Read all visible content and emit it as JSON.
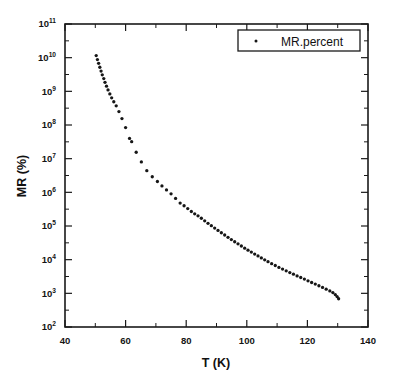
{
  "figure": {
    "background_color": "#ffffff",
    "ink_color": "#161616"
  },
  "axes": {
    "x_title": "T (K)",
    "y_title": "MR (%)",
    "x_ticklabels": [
      "40",
      "60",
      "80",
      "100",
      "120",
      "140"
    ],
    "x_tickvalues": [
      40,
      60,
      80,
      100,
      120,
      140
    ],
    "x_minor_tickvalues": [
      50,
      70,
      90,
      110,
      130
    ],
    "y_ticklabels": [
      "10²",
      "10³",
      "10⁴",
      "10⁵",
      "10⁶",
      "10⁷",
      "10⁸",
      "10⁹",
      "10¹⁰",
      "10¹¹"
    ],
    "y_tick_mantissa": "10",
    "y_tick_exponents": [
      "2",
      "3",
      "4",
      "5",
      "6",
      "7",
      "8",
      "9",
      "10",
      "11"
    ]
  },
  "legend": {
    "entries": [
      {
        "label": "MR.percent",
        "marker": "dot",
        "color": "#161616"
      }
    ],
    "position": "top-right",
    "border": true
  },
  "chart_data": {
    "type": "scatter",
    "title": "",
    "xlabel": "T (K)",
    "ylabel": "MR (%)",
    "xlim": [
      40,
      140
    ],
    "ylim": [
      100,
      100000000000
    ],
    "yscale": "log",
    "xscale": "linear",
    "grid": false,
    "legend_position": "top-right",
    "series": [
      {
        "name": "MR.percent",
        "marker": "dot",
        "color": "#161616",
        "x": [
          50.3,
          50.7,
          51.1,
          51.5,
          51.9,
          52.3,
          52.8,
          53.2,
          53.7,
          54.2,
          54.8,
          55.4,
          56.1,
          56.9,
          57.8,
          58.8,
          60.0,
          61.3,
          62.0,
          63.5,
          65.2,
          67.0,
          68.8,
          70.5,
          72.0,
          73.5,
          75.0,
          76.5,
          78.0,
          79.3,
          80.5,
          81.7,
          82.8,
          83.9,
          85.0,
          86.1,
          87.2,
          88.3,
          89.4,
          90.5,
          91.6,
          92.7,
          93.8,
          94.9,
          96.0,
          97.1,
          98.2,
          99.3,
          100.4,
          101.5,
          102.6,
          103.7,
          104.8,
          105.9,
          107.0,
          108.2,
          109.4,
          110.6,
          111.8,
          113.0,
          114.2,
          115.4,
          116.6,
          117.8,
          119.0,
          120.2,
          121.4,
          122.6,
          123.8,
          125.0,
          126.2,
          127.4,
          128.4,
          129.2,
          129.8,
          130.3
        ],
        "y": [
          11500000000.0,
          8800000000.0,
          6800000000.0,
          5200000000.0,
          4000000000.0,
          3100000000.0,
          2400000000.0,
          1850000000.0,
          1420000000.0,
          1100000000.0,
          840000000.0,
          640000000.0,
          490000000.0,
          370000000.0,
          250000000.0,
          155000000.0,
          84000000.0,
          40000000.0,
          32000000.0,
          15500000.0,
          8000000.0,
          4400000.0,
          2900000.0,
          2100000.0,
          1550000.0,
          1180000.0,
          900000.0,
          660000.0,
          480000.0,
          400000.0,
          330000.0,
          270000.0,
          230000.0,
          200000.0,
          170000.0,
          142000.0,
          120000.0,
          102000.0,
          87000.0,
          74000.0,
          63000.0,
          54000.0,
          46000.0,
          39500.0,
          34000.0,
          29500.0,
          25500.0,
          22000.0,
          19200.0,
          16800.0,
          14700.0,
          12900.0,
          11300.0,
          9900.0,
          8700.0,
          7600.0,
          6700.0,
          5900.0,
          5250.0,
          4650.0,
          4150.0,
          3700.0,
          3300.0,
          2950.0,
          2650.0,
          2350.0,
          2100.0,
          1880.0,
          1680.0,
          1500.0,
          1330.0,
          1180.0,
          1050.0,
          920.0,
          800.0,
          690.0
        ]
      }
    ]
  }
}
